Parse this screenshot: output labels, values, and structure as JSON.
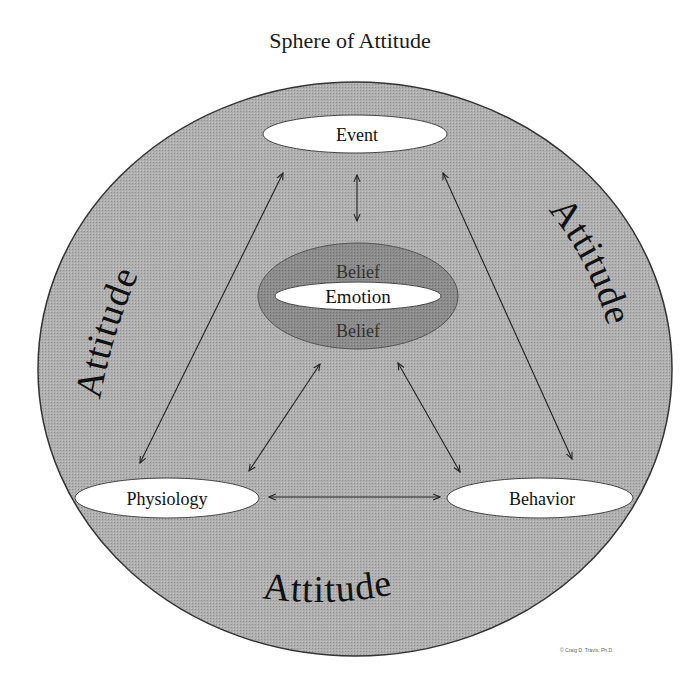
{
  "title": "Sphere of Attitude",
  "colors": {
    "sphere_fill": "#a9a9a9",
    "belief_fill": "#8a8a8a",
    "node_fill": "#ffffff",
    "stroke": "#222222"
  },
  "nodes": {
    "event": "Event",
    "emotion": "Emotion",
    "belief_top": "Belief",
    "belief_bottom": "Belief",
    "physiology": "Physiology",
    "behavior": "Behavior"
  },
  "ring_labels": {
    "left": "Attitude",
    "right": "Attitude",
    "bottom": "Attitude"
  },
  "connections": [
    {
      "from": "Event",
      "to": "Belief/Emotion",
      "type": "bidirectional"
    },
    {
      "from": "Event",
      "to": "Physiology",
      "type": "bidirectional"
    },
    {
      "from": "Event",
      "to": "Behavior",
      "type": "bidirectional"
    },
    {
      "from": "Belief/Emotion",
      "to": "Physiology",
      "type": "bidirectional"
    },
    {
      "from": "Belief/Emotion",
      "to": "Behavior",
      "type": "bidirectional"
    },
    {
      "from": "Physiology",
      "to": "Behavior",
      "type": "bidirectional"
    }
  ],
  "copyright": "© Craig D. Travis, Ph.D."
}
